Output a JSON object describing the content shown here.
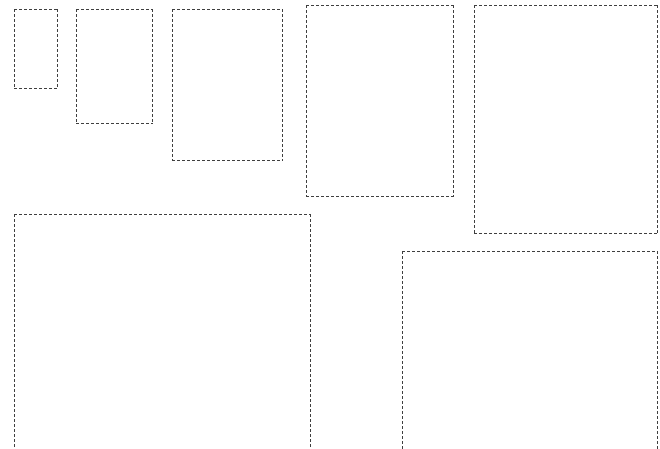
{
  "canvas": {
    "width": 660,
    "height": 449,
    "background_color": "#ffffff"
  },
  "annotation_style": {
    "stroke_color": "#3f3f3f",
    "stroke_width_px": 1,
    "dash_length_px": 3,
    "gap_length_px": 2,
    "fill": "none"
  },
  "boxes": [
    {
      "id": "box-1",
      "label": "region-1",
      "x": 14,
      "y": 9,
      "width": 44,
      "height": 80,
      "clipped_bottom": false
    },
    {
      "id": "box-2",
      "label": "region-2",
      "x": 76,
      "y": 9,
      "width": 77,
      "height": 115,
      "clipped_bottom": false
    },
    {
      "id": "box-3",
      "label": "region-3",
      "x": 172,
      "y": 9,
      "width": 111,
      "height": 152,
      "clipped_bottom": false
    },
    {
      "id": "box-4",
      "label": "region-4",
      "x": 306,
      "y": 5,
      "width": 148,
      "height": 192,
      "clipped_bottom": false
    },
    {
      "id": "box-5",
      "label": "region-5",
      "x": 474,
      "y": 5,
      "width": 184,
      "height": 229,
      "clipped_bottom": false
    },
    {
      "id": "box-6",
      "label": "region-6",
      "x": 14,
      "y": 214,
      "width": 297,
      "height": 236,
      "clipped_bottom": true
    },
    {
      "id": "box-7",
      "label": "region-7",
      "x": 402,
      "y": 251,
      "width": 256,
      "height": 199,
      "clipped_bottom": true
    }
  ]
}
